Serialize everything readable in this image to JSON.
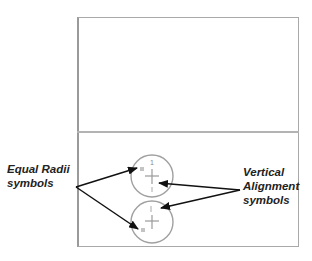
{
  "labels": {
    "equal_radii_line1": "Equal Radii",
    "equal_radii_line2": "symbols",
    "vertical_line1": "Vertical",
    "vertical_line2": "Alignment",
    "vertical_line3": "symbols"
  },
  "symbols": {
    "radius_constraint_mark": "=",
    "vertical_constraint_mark": "1"
  },
  "colors": {
    "frame": "#a9a9a9",
    "circle": "#a0a0a0",
    "arrow": "#111111",
    "text": "#222222"
  }
}
